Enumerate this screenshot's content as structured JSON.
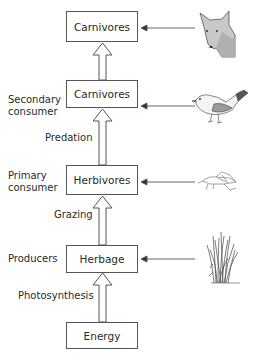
{
  "diagram": {
    "type": "food-chain",
    "levels": [
      {
        "box": "Carnivores",
        "side_label": "",
        "organism": "fox-head"
      },
      {
        "box": "Carnivores",
        "side_label": "Secondary consumer",
        "organism": "bird"
      },
      {
        "box": "Herbivores",
        "side_label": "Primary consumer",
        "organism": "grasshopper"
      },
      {
        "box": "Herbage",
        "side_label": "Producers",
        "organism": "grass"
      },
      {
        "box": "Energy",
        "side_label": "",
        "organism": ""
      }
    ],
    "transitions": [
      {
        "from": "Carnivores",
        "to": "Carnivores",
        "label": ""
      },
      {
        "from": "Herbivores",
        "to": "Carnivores",
        "label": "Predation"
      },
      {
        "from": "Herbage",
        "to": "Herbivores",
        "label": "Grazing"
      },
      {
        "from": "Energy",
        "to": "Herbage",
        "label": "Photosynthesis"
      }
    ],
    "labels": {
      "secondary_line1": "Secondary",
      "secondary_line2": "consumer",
      "primary_line1": "Primary",
      "primary_line2": "consumer",
      "producers": "Producers",
      "predation": "Predation",
      "grazing": "Grazing",
      "photosynthesis": "Photosynthesis"
    }
  }
}
